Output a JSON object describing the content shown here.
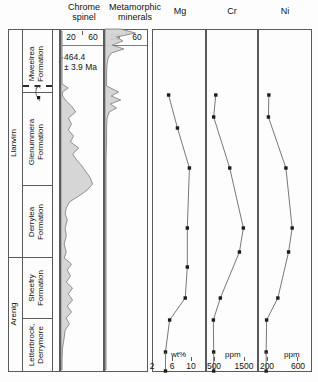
{
  "figure": {
    "width": 318,
    "height": 382,
    "background": "#ffffff"
  },
  "columns": {
    "chrome_spinel": {
      "title": "Chrome\nspinel"
    },
    "metamorphic": {
      "title": "Metamorphic\nminerals"
    },
    "mg": {
      "title": "Mg"
    },
    "cr": {
      "title": "Cr"
    },
    "ni": {
      "title": "Ni"
    }
  },
  "stratigraphy": {
    "series_label_llanvirn": "Llanvirn",
    "series_label_arenig": "Arenig",
    "formations": [
      {
        "name": "Mweelrea\nFormation"
      },
      {
        "name": "Glenummera\nFormation"
      },
      {
        "name": "Derrylea\nFormation"
      },
      {
        "name": "Sheefry\nFormation"
      },
      {
        "name": "Letterbrock,\nDerrymore"
      }
    ]
  },
  "annotation": {
    "age": "464.4\n± 3.9 Ma"
  },
  "axes": {
    "chrome_spinel": {
      "ticks": [
        "20",
        "60"
      ],
      "unit": ""
    },
    "metamorphic": {
      "ticks": [
        "20",
        "60"
      ],
      "unit": ""
    },
    "mg": {
      "ticks": [
        "2",
        "6",
        "10"
      ],
      "unit": "wt%"
    },
    "cr": {
      "ticks": [
        "500",
        "1500"
      ],
      "unit": "ppm"
    },
    "ni": {
      "ticks": [
        "200",
        "600"
      ],
      "unit": "ppm"
    }
  },
  "chart_data": {
    "type": "line",
    "orientation": "vertical-stratigraphic",
    "ylabel": "Stratigraphy (formation, youngest at top)",
    "grid": false,
    "legend": "none",
    "stratigraphic_units": [
      {
        "series": "Llanvirn",
        "formation": "Mweelrea Formation",
        "top_px": 29,
        "bottom_px": 81
      },
      {
        "series": "Llanvirn",
        "formation": "Glenummera Formation",
        "top_px": 92,
        "bottom_px": 185
      },
      {
        "series": "Llanvirn",
        "formation": "Derrylea Formation",
        "top_px": 185,
        "bottom_px": 257
      },
      {
        "series": "Arenig",
        "formation": "Sheefry Formation",
        "top_px": 257,
        "bottom_px": 318
      },
      {
        "series": "Arenig",
        "formation": "Letterbrock, Derrymore",
        "top_px": 318,
        "bottom_px": 372
      }
    ],
    "unconformity_depth_px": 85,
    "age_constraint": {
      "value": 464.4,
      "error": 3.9,
      "unit": "Ma",
      "depth_px": 85
    },
    "panels": [
      {
        "name": "Chrome spinel",
        "type": "area",
        "xlabel": "",
        "xlim": [
          0,
          80
        ],
        "xticks": [
          20,
          60
        ],
        "values": [
          {
            "depth": 31,
            "v": 2
          },
          {
            "depth": 40,
            "v": 2
          },
          {
            "depth": 52,
            "v": 2
          },
          {
            "depth": 64,
            "v": 2
          },
          {
            "depth": 78,
            "v": 2
          },
          {
            "depth": 84,
            "v": 2
          },
          {
            "depth": 88,
            "v": 14
          },
          {
            "depth": 92,
            "v": 3
          },
          {
            "depth": 96,
            "v": 3
          },
          {
            "depth": 101,
            "v": 10
          },
          {
            "depth": 106,
            "v": 20
          },
          {
            "depth": 112,
            "v": 28
          },
          {
            "depth": 118,
            "v": 14
          },
          {
            "depth": 124,
            "v": 20
          },
          {
            "depth": 130,
            "v": 14
          },
          {
            "depth": 136,
            "v": 24
          },
          {
            "depth": 142,
            "v": 18
          },
          {
            "depth": 148,
            "v": 34
          },
          {
            "depth": 154,
            "v": 22
          },
          {
            "depth": 160,
            "v": 30
          },
          {
            "depth": 166,
            "v": 40
          },
          {
            "depth": 172,
            "v": 48
          },
          {
            "depth": 178,
            "v": 56
          },
          {
            "depth": 184,
            "v": 60
          },
          {
            "depth": 190,
            "v": 50
          },
          {
            "depth": 196,
            "v": 34
          },
          {
            "depth": 202,
            "v": 16
          },
          {
            "depth": 208,
            "v": 10
          },
          {
            "depth": 214,
            "v": 8
          },
          {
            "depth": 220,
            "v": 12
          },
          {
            "depth": 228,
            "v": 8
          },
          {
            "depth": 236,
            "v": 10
          },
          {
            "depth": 244,
            "v": 6
          },
          {
            "depth": 252,
            "v": 10
          },
          {
            "depth": 258,
            "v": 6
          },
          {
            "depth": 264,
            "v": 20
          },
          {
            "depth": 270,
            "v": 12
          },
          {
            "depth": 276,
            "v": 18
          },
          {
            "depth": 282,
            "v": 10
          },
          {
            "depth": 288,
            "v": 22
          },
          {
            "depth": 294,
            "v": 14
          },
          {
            "depth": 300,
            "v": 22
          },
          {
            "depth": 306,
            "v": 12
          },
          {
            "depth": 312,
            "v": 20
          },
          {
            "depth": 318,
            "v": 10
          },
          {
            "depth": 324,
            "v": 16
          },
          {
            "depth": 330,
            "v": 8
          },
          {
            "depth": 338,
            "v": 6
          },
          {
            "depth": 348,
            "v": 3
          },
          {
            "depth": 360,
            "v": 2
          },
          {
            "depth": 370,
            "v": 2
          }
        ]
      },
      {
        "name": "Metamorphic minerals",
        "type": "area",
        "xlabel": "",
        "xlim": [
          0,
          80
        ],
        "xticks": [
          20,
          60
        ],
        "values": [
          {
            "depth": 29,
            "v": 30
          },
          {
            "depth": 33,
            "v": 58
          },
          {
            "depth": 37,
            "v": 22
          },
          {
            "depth": 41,
            "v": 34
          },
          {
            "depth": 45,
            "v": 14
          },
          {
            "depth": 49,
            "v": 36
          },
          {
            "depth": 53,
            "v": 12
          },
          {
            "depth": 58,
            "v": 6
          },
          {
            "depth": 64,
            "v": 4
          },
          {
            "depth": 72,
            "v": 3
          },
          {
            "depth": 80,
            "v": 3
          },
          {
            "depth": 86,
            "v": 3
          },
          {
            "depth": 92,
            "v": 26
          },
          {
            "depth": 96,
            "v": 12
          },
          {
            "depth": 100,
            "v": 30
          },
          {
            "depth": 104,
            "v": 10
          },
          {
            "depth": 108,
            "v": 22
          },
          {
            "depth": 112,
            "v": 8
          },
          {
            "depth": 118,
            "v": 4
          },
          {
            "depth": 128,
            "v": 3
          },
          {
            "depth": 140,
            "v": 3
          },
          {
            "depth": 160,
            "v": 2
          },
          {
            "depth": 200,
            "v": 2
          },
          {
            "depth": 260,
            "v": 2
          },
          {
            "depth": 320,
            "v": 2
          },
          {
            "depth": 370,
            "v": 2
          }
        ]
      },
      {
        "name": "Mg",
        "type": "line",
        "xlabel": "wt%",
        "unit": "wt%",
        "xlim": [
          2,
          12
        ],
        "xticks": [
          2,
          6,
          10
        ],
        "points": [
          {
            "depth": 95,
            "value": 5.0
          },
          {
            "depth": 128,
            "value": 6.7
          },
          {
            "depth": 168,
            "value": 9.0
          },
          {
            "depth": 228,
            "value": 8.6
          },
          {
            "depth": 267,
            "value": 8.6
          },
          {
            "depth": 298,
            "value": 8.2
          },
          {
            "depth": 320,
            "value": 5.2
          },
          {
            "depth": 352,
            "value": 4.4
          }
        ]
      },
      {
        "name": "Cr",
        "type": "line",
        "xlabel": "ppm",
        "unit": "ppm",
        "xlim": [
          250,
          1900
        ],
        "xticks": [
          500,
          1500
        ],
        "points": [
          {
            "depth": 95,
            "value": 540
          },
          {
            "depth": 117,
            "value": 470
          },
          {
            "depth": 168,
            "value": 1000
          },
          {
            "depth": 228,
            "value": 1450
          },
          {
            "depth": 252,
            "value": 1320
          },
          {
            "depth": 298,
            "value": 690
          },
          {
            "depth": 320,
            "value": 460
          },
          {
            "depth": 352,
            "value": 470
          }
        ]
      },
      {
        "name": "Ni",
        "type": "line",
        "xlabel": "ppm",
        "unit": "ppm",
        "xlim": [
          120,
          700
        ],
        "xticks": [
          200,
          600
        ],
        "points": [
          {
            "depth": 95,
            "value": 230
          },
          {
            "depth": 117,
            "value": 225
          },
          {
            "depth": 168,
            "value": 420
          },
          {
            "depth": 228,
            "value": 490
          },
          {
            "depth": 252,
            "value": 450
          },
          {
            "depth": 298,
            "value": 330
          },
          {
            "depth": 320,
            "value": 205
          },
          {
            "depth": 352,
            "value": 200
          }
        ]
      }
    ]
  }
}
